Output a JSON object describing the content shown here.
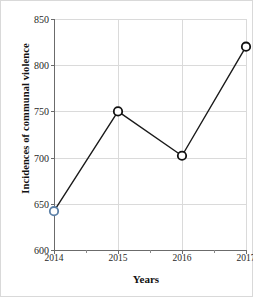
{
  "chart_data": {
    "type": "line",
    "title": "",
    "xlabel": "Years",
    "ylabel": "Incidences of communal violence",
    "categories": [
      "2014",
      "2015",
      "2016",
      "2017"
    ],
    "x": [
      2014,
      2015,
      2016,
      2017
    ],
    "values": [
      642,
      750,
      702,
      820
    ],
    "series": [
      {
        "name": "Incidences of communal violence",
        "values": [
          642,
          750,
          702,
          820
        ]
      }
    ],
    "xlim": [
      2014,
      2017
    ],
    "ylim": [
      600,
      850
    ],
    "yticks": [
      600,
      650,
      700,
      750,
      800,
      850
    ],
    "ytick_labels": [
      "600",
      "650",
      "700",
      "750",
      "800",
      "850"
    ],
    "xticks": [
      2014,
      2015,
      2016,
      2017
    ],
    "xtick_labels": [
      "2014",
      "2015",
      "2016",
      "2017"
    ],
    "x_minor_ticks": [
      2014.5,
      2015.5,
      2016.5
    ],
    "grid": true,
    "grid_axis": "both",
    "legend": "none",
    "marker": "open-circle",
    "line_color": "#1a1a1a",
    "marker_edge_colors": [
      "#5b7fa6",
      "#111111",
      "#111111",
      "#111111"
    ],
    "marker_face_color": "#ffffff",
    "grid_color": "#dadada",
    "axis_color": "#6b6b6b",
    "background_color": "#ffffff"
  }
}
